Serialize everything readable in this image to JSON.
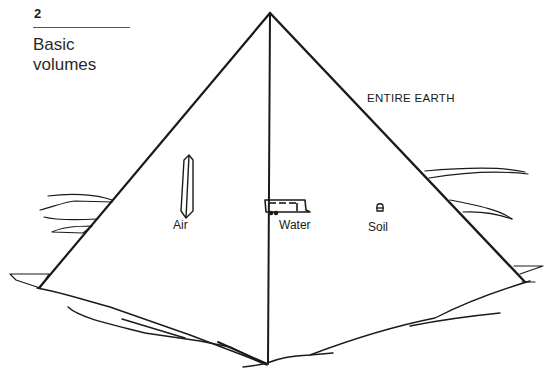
{
  "figure": {
    "number": "2",
    "title_line1": "Basic",
    "title_line2": "volumes"
  },
  "labels": {
    "entire_earth": "ENTIRE EARTH",
    "air": "Air",
    "water": "Water",
    "soil": "Soil"
  },
  "icons": {
    "air": "obelisk-icon",
    "water": "trailer-icon",
    "soil": "thimble-icon"
  },
  "colors": {
    "background": "#ffffff",
    "ink": "#1a1a1a"
  }
}
